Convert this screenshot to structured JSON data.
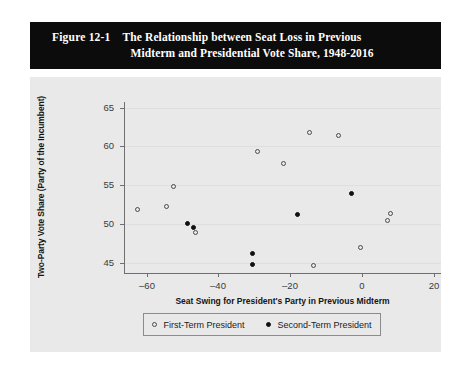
{
  "figure": {
    "number": "Figure 12-1",
    "title_line1": "The Relationship between Seat Loss in Previous",
    "title_line2": "Midterm and Presidential Vote Share, 1948-2016",
    "banner_color": "#0d0c0c",
    "panel_color": "#e9e9e9"
  },
  "chart_data": {
    "type": "scatter",
    "title": "The Relationship between Seat Loss in Previous Midterm and Presidential Vote Share, 1948-2016",
    "xlabel": "Seat Swing for President's Party in Previous Midterm",
    "ylabel": "Two-Party Vote Share (Party of the Incumbent)",
    "xlim": [
      -66,
      22
    ],
    "ylim": [
      43.8,
      65.6
    ],
    "xticks": [
      -60,
      -40,
      -20,
      0,
      20
    ],
    "xtick_labels": [
      "–60",
      "–40",
      "–20",
      "0",
      "20"
    ],
    "yticks": [
      45,
      50,
      55,
      60,
      65
    ],
    "ytick_labels": [
      "45",
      "50",
      "55",
      "60",
      "65"
    ],
    "grid": true,
    "legend_position": "below-axis",
    "series": [
      {
        "name": "First-Term President",
        "marker": "open-circle",
        "color": "#4a4a4a",
        "points": [
          {
            "x": -62.5,
            "y": 51.9
          },
          {
            "x": -54.5,
            "y": 52.3
          },
          {
            "x": -52.5,
            "y": 54.8
          },
          {
            "x": -46.5,
            "y": 48.9
          },
          {
            "x": -29.0,
            "y": 59.3
          },
          {
            "x": -22.0,
            "y": 57.8
          },
          {
            "x": -14.5,
            "y": 61.8
          },
          {
            "x": -13.5,
            "y": 44.6
          },
          {
            "x": -6.5,
            "y": 61.4
          },
          {
            "x": -0.5,
            "y": 46.9
          },
          {
            "x": 7.0,
            "y": 50.4
          },
          {
            "x": 8.0,
            "y": 51.4
          }
        ]
      },
      {
        "name": "Second-Term President",
        "marker": "filled-circle",
        "color": "#111111",
        "points": [
          {
            "x": -48.5,
            "y": 50.0
          },
          {
            "x": -47.0,
            "y": 49.6
          },
          {
            "x": -30.5,
            "y": 46.2
          },
          {
            "x": -30.5,
            "y": 44.8
          },
          {
            "x": -18.0,
            "y": 51.2
          },
          {
            "x": -3.0,
            "y": 53.9
          }
        ]
      }
    ]
  },
  "legend": {
    "items": [
      {
        "label": "First-Term President",
        "marker": "open-circle"
      },
      {
        "label": "Second-Term President",
        "marker": "filled-circle"
      }
    ]
  }
}
